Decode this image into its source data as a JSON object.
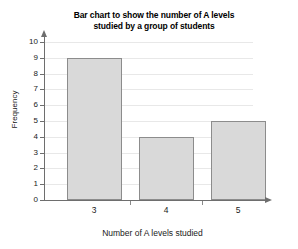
{
  "chart_data": {
    "type": "bar",
    "title": "Bar chart to show the number of A levels studied by a group of students",
    "title_line1": "Bar chart to show the number of A levels",
    "title_line2": "studied by a group of students",
    "xlabel": "Number of A levels studied",
    "ylabel": "Frequency",
    "categories": [
      "3",
      "4",
      "5"
    ],
    "values": [
      9,
      4,
      5
    ],
    "ylim": [
      0,
      10
    ],
    "ytick_labels": [
      "0",
      "1",
      "2",
      "3",
      "4",
      "5",
      "6",
      "7",
      "8",
      "9",
      "10"
    ],
    "yticks": [
      0,
      1,
      2,
      3,
      4,
      5,
      6,
      7,
      8,
      9,
      10
    ],
    "grid": true,
    "legend": "none",
    "bar_fill_color": "#d9d9d9",
    "bar_border_color": "#8c8c8c",
    "axis_color": "#6e6e6e",
    "gridline_color": "#e8e8e8",
    "background_color": "#ffffff"
  }
}
